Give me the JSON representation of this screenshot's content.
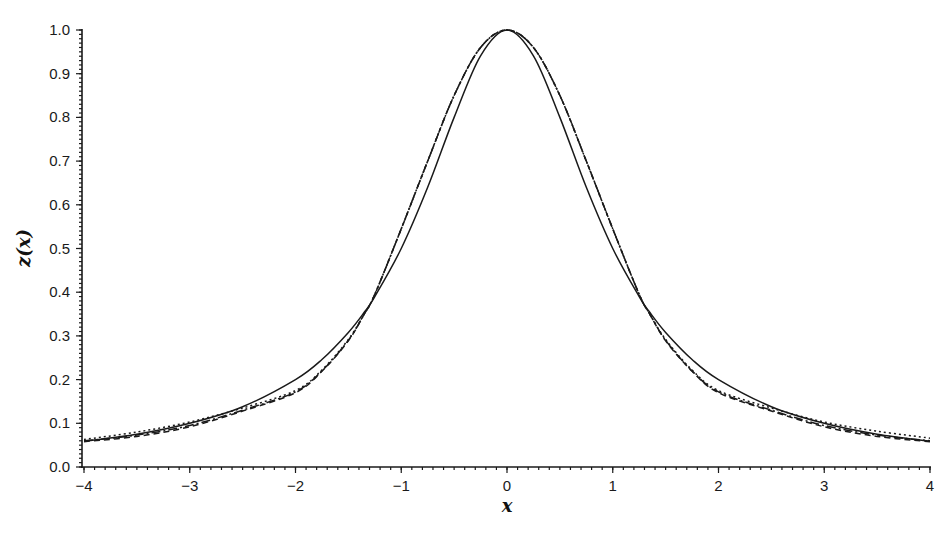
{
  "chart_data": {
    "type": "line",
    "title": "",
    "xlabel": "x",
    "ylabel": "z(x)",
    "xlim": [
      -4,
      4
    ],
    "ylim": [
      0,
      1.0
    ],
    "grid": false,
    "legend": null,
    "x_ticks": [
      "-4",
      "-3",
      "-2",
      "-1",
      "0",
      "1",
      "2",
      "3",
      "4"
    ],
    "y_ticks": [
      "0.0",
      "0.1",
      "0.2",
      "0.3",
      "0.4",
      "0.5",
      "0.6",
      "0.7",
      "0.8",
      "0.9",
      "1.0"
    ],
    "x": [
      -4,
      -3.5,
      -3,
      -2.5,
      -2,
      -1.75,
      -1.5,
      -1.35,
      -1.25,
      -1,
      -0.75,
      -0.5,
      -0.25,
      0,
      0.25,
      0.5,
      0.75,
      1,
      1.25,
      1.35,
      1.5,
      1.75,
      2,
      2.5,
      3,
      3.5,
      4
    ],
    "series": [
      {
        "name": "solid",
        "style": "solid",
        "values": [
          0.059,
          0.075,
          0.1,
          0.138,
          0.2,
          0.246,
          0.308,
          0.354,
          0.39,
          0.5,
          0.64,
          0.8,
          0.941,
          1.0,
          0.941,
          0.8,
          0.64,
          0.5,
          0.39,
          0.354,
          0.308,
          0.246,
          0.2,
          0.138,
          0.1,
          0.075,
          0.059
        ]
      },
      {
        "name": "dash-dot",
        "style": "dashdot",
        "values": [
          0.06,
          0.073,
          0.095,
          0.13,
          0.172,
          0.22,
          0.29,
          0.35,
          0.395,
          0.545,
          0.7,
          0.85,
          0.96,
          1.0,
          0.96,
          0.85,
          0.7,
          0.545,
          0.395,
          0.35,
          0.29,
          0.22,
          0.172,
          0.13,
          0.095,
          0.073,
          0.06
        ]
      },
      {
        "name": "dotted",
        "style": "dotted",
        "values": [
          0.063,
          0.08,
          0.103,
          0.135,
          0.175,
          0.222,
          0.292,
          0.35,
          0.395,
          0.545,
          0.7,
          0.85,
          0.96,
          1.0,
          0.96,
          0.85,
          0.7,
          0.545,
          0.395,
          0.35,
          0.292,
          0.222,
          0.175,
          0.135,
          0.103,
          0.082,
          0.066
        ]
      },
      {
        "name": "dashed",
        "style": "dashed",
        "values": [
          0.058,
          0.07,
          0.092,
          0.128,
          0.17,
          0.219,
          0.289,
          0.35,
          0.395,
          0.545,
          0.7,
          0.85,
          0.96,
          1.0,
          0.96,
          0.85,
          0.7,
          0.545,
          0.395,
          0.35,
          0.289,
          0.219,
          0.17,
          0.128,
          0.092,
          0.07,
          0.058
        ]
      }
    ]
  }
}
